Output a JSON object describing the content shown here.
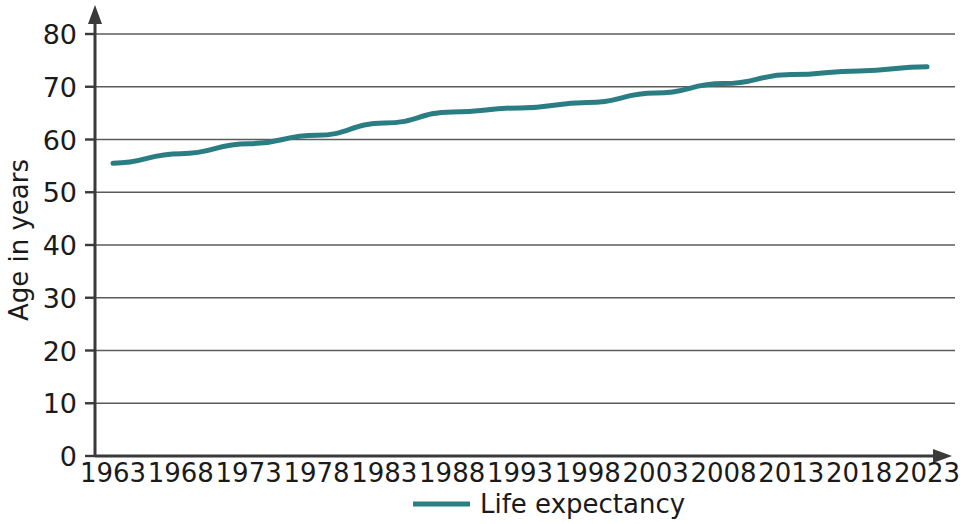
{
  "chart_data": {
    "type": "line",
    "title": "",
    "subtitle": "",
    "xlabel": "",
    "ylabel": "Age in years",
    "x": [
      1963,
      1968,
      1973,
      1978,
      1983,
      1988,
      1993,
      1998,
      2003,
      2008,
      2013,
      2018,
      2023
    ],
    "categories": [
      "1963",
      "1968",
      "1973",
      "1978",
      "1983",
      "1988",
      "1993",
      "1998",
      "2003",
      "2008",
      "2013",
      "2018",
      "2023"
    ],
    "series": [
      {
        "name": "Life expectancy",
        "color": "#2b7d84",
        "values": [
          55.5,
          57.3,
          59.2,
          60.8,
          63.1,
          65.2,
          66.0,
          67.0,
          68.8,
          70.6,
          72.3,
          73.0,
          73.8
        ]
      }
    ],
    "ylim": [
      0,
      80
    ],
    "yticks": [
      0,
      10,
      20,
      30,
      40,
      50,
      60,
      70,
      80
    ],
    "ytick_labels": [
      "0",
      "10",
      "20",
      "30",
      "40",
      "50",
      "60",
      "70",
      "80"
    ],
    "xlim": [
      1963,
      2023
    ],
    "grid": "horizontal",
    "legend_position": "bottom-center",
    "legend_entries": [
      "Life expectancy"
    ],
    "axis_arrows": true
  },
  "legend": {
    "items": [
      {
        "label": "Life expectancy",
        "color": "#2b7d84"
      }
    ]
  },
  "colors": {
    "series": "#2b7d84",
    "gridline": "#5b5b5b",
    "axis": "#3a3a3a",
    "text": "#1a1a1a",
    "background": "#ffffff"
  }
}
